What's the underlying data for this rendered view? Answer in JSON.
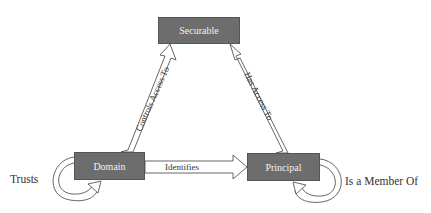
{
  "diagram": {
    "nodes": [
      {
        "id": "securable",
        "label": "Securable"
      },
      {
        "id": "domain",
        "label": "Domain"
      },
      {
        "id": "principal",
        "label": "Principal"
      }
    ],
    "edges": [
      {
        "from": "domain",
        "to": "securable",
        "label": "Controls Access To"
      },
      {
        "from": "principal",
        "to": "securable",
        "label": "Has Access To"
      },
      {
        "from": "domain",
        "to": "principal",
        "label": "Identifies"
      },
      {
        "from": "domain",
        "to": "domain",
        "label": "Trusts"
      },
      {
        "from": "principal",
        "to": "principal",
        "label": "Is a Member Of"
      }
    ],
    "colors": {
      "node_fill": "#6d6d6d",
      "node_text": "#f2f2f2",
      "arrow_stroke": "#555555",
      "label_text": "#333333"
    }
  }
}
